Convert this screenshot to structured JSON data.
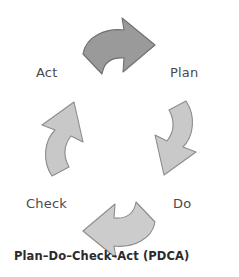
{
  "diagram": {
    "title": "Plan–Do–Check–Act (PDCA)",
    "background_color": "#ffffff",
    "stages": [
      {
        "key": "act",
        "label": "Act"
      },
      {
        "key": "plan",
        "label": "Plan"
      },
      {
        "key": "check",
        "label": "Check"
      },
      {
        "key": "do",
        "label": "Do"
      }
    ],
    "caption": "Plan–Do–Check–Act (PDCA)",
    "label_color": "#4a4a4a",
    "caption_color": "#2b2b2b",
    "arrows": [
      {
        "key": "top",
        "name": "arrow-top-act-to-plan",
        "from": "Act",
        "to": "Plan",
        "direction": "clockwise-down-right",
        "fill": "#9a9a9a",
        "stroke": "#6f6f6f"
      },
      {
        "key": "right",
        "name": "arrow-right-plan-to-do",
        "from": "Plan",
        "to": "Do",
        "direction": "clockwise-down-left",
        "fill": "#c9c9c9",
        "stroke": "#8c8c8c"
      },
      {
        "key": "bottom",
        "name": "arrow-bottom-do-to-check",
        "from": "Do",
        "to": "Check",
        "direction": "clockwise-up-left",
        "fill": "#cccccc",
        "stroke": "#8c8c8c"
      },
      {
        "key": "left",
        "name": "arrow-left-check-to-act",
        "from": "Check",
        "to": "Act",
        "direction": "clockwise-up",
        "fill": "#c8c8c8",
        "stroke": "#8c8c8c"
      }
    ]
  }
}
